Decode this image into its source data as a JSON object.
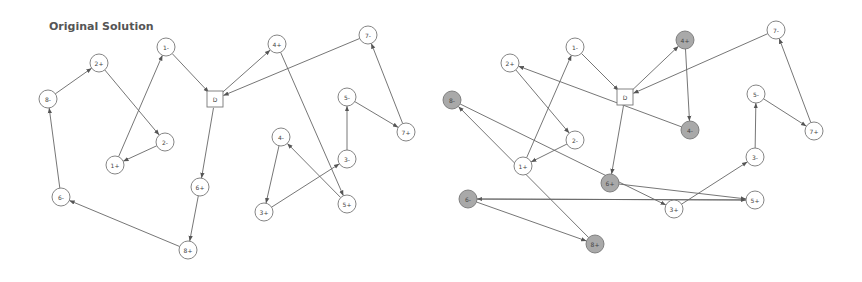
{
  "title": "Original Solution",
  "colors": {
    "edge": "#666666",
    "node_stroke": "#777777",
    "node_fill": "#ffffff",
    "shaded_fill": "#a9a9a9"
  },
  "diagrams": [
    {
      "name": "original-solution",
      "nodes": [
        {
          "id": "8-",
          "x": 48,
          "y": 99
        },
        {
          "id": "2+",
          "x": 99,
          "y": 63
        },
        {
          "id": "1-",
          "x": 166,
          "y": 47
        },
        {
          "id": "D",
          "x": 215,
          "y": 99,
          "shape": "square"
        },
        {
          "id": "4+",
          "x": 277,
          "y": 44
        },
        {
          "id": "7-",
          "x": 368,
          "y": 35
        },
        {
          "id": "2-",
          "x": 165,
          "y": 142
        },
        {
          "id": "1+",
          "x": 115,
          "y": 165
        },
        {
          "id": "6+",
          "x": 200,
          "y": 187
        },
        {
          "id": "8+",
          "x": 188,
          "y": 250
        },
        {
          "id": "6-",
          "x": 61,
          "y": 197
        },
        {
          "id": "4-",
          "x": 281,
          "y": 137
        },
        {
          "id": "3+",
          "x": 264,
          "y": 212
        },
        {
          "id": "3-",
          "x": 347,
          "y": 159
        },
        {
          "id": "5+",
          "x": 347,
          "y": 204
        },
        {
          "id": "5-",
          "x": 347,
          "y": 97
        },
        {
          "id": "7+",
          "x": 406,
          "y": 132
        }
      ],
      "edges": [
        [
          "8-",
          "2+"
        ],
        [
          "2+",
          "2-"
        ],
        [
          "2-",
          "1+"
        ],
        [
          "1+",
          "1-"
        ],
        [
          "1-",
          "D"
        ],
        [
          "D",
          "4+"
        ],
        [
          "4+",
          "5+"
        ],
        [
          "5+",
          "4-"
        ],
        [
          "4-",
          "3+"
        ],
        [
          "3+",
          "3-"
        ],
        [
          "3-",
          "5-"
        ],
        [
          "5-",
          "7+"
        ],
        [
          "7+",
          "7-"
        ],
        [
          "7-",
          "D"
        ],
        [
          "D",
          "6+"
        ],
        [
          "6+",
          "8+"
        ],
        [
          "8+",
          "6-"
        ],
        [
          "6-",
          "8-"
        ]
      ]
    },
    {
      "name": "modified-solution",
      "nodes": [
        {
          "id": "2+",
          "x": 510,
          "y": 63
        },
        {
          "id": "1-",
          "x": 575,
          "y": 47
        },
        {
          "id": "D",
          "x": 625,
          "y": 97,
          "shape": "square"
        },
        {
          "id": "4+",
          "x": 685,
          "y": 40,
          "shaded": true
        },
        {
          "id": "7-",
          "x": 776,
          "y": 30
        },
        {
          "id": "8-",
          "x": 452,
          "y": 100,
          "shaded": true
        },
        {
          "id": "4-",
          "x": 690,
          "y": 130,
          "shaded": true
        },
        {
          "id": "5-",
          "x": 756,
          "y": 94
        },
        {
          "id": "7+",
          "x": 814,
          "y": 131
        },
        {
          "id": "2-",
          "x": 575,
          "y": 140
        },
        {
          "id": "1+",
          "x": 523,
          "y": 166
        },
        {
          "id": "6+",
          "x": 610,
          "y": 183,
          "shaded": true
        },
        {
          "id": "3-",
          "x": 755,
          "y": 157
        },
        {
          "id": "5+",
          "x": 755,
          "y": 200
        },
        {
          "id": "3+",
          "x": 674,
          "y": 209
        },
        {
          "id": "6-",
          "x": 468,
          "y": 199,
          "shaded": true
        },
        {
          "id": "8+",
          "x": 595,
          "y": 244,
          "shaded": true
        }
      ],
      "edges": [
        [
          "1+",
          "1-"
        ],
        [
          "1-",
          "D"
        ],
        [
          "D",
          "4+"
        ],
        [
          "4+",
          "4-"
        ],
        [
          "4-",
          "2+"
        ],
        [
          "2+",
          "2-"
        ],
        [
          "2-",
          "1+"
        ],
        [
          "7-",
          "D"
        ],
        [
          "5-",
          "7+"
        ],
        [
          "7+",
          "7-"
        ],
        [
          "3-",
          "5-"
        ],
        [
          "3+",
          "3-"
        ],
        [
          "D",
          "6+"
        ],
        [
          "8-",
          "3+"
        ],
        [
          "6+",
          "5+"
        ],
        [
          "5+",
          "6-"
        ],
        [
          "6-",
          "5+"
        ],
        [
          "6-",
          "8+"
        ],
        [
          "8+",
          "8-"
        ]
      ]
    }
  ]
}
